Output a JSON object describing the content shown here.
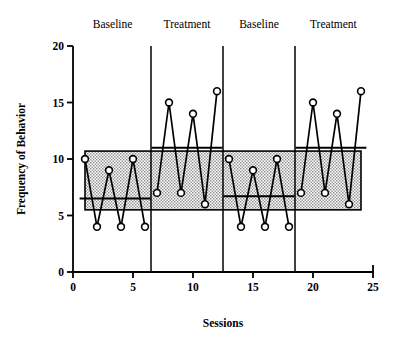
{
  "chart_data": {
    "type": "line",
    "title": "",
    "xlabel": "Sessions",
    "ylabel": "Frequency of Behavior",
    "xlim": [
      0,
      25
    ],
    "ylim": [
      0,
      20
    ],
    "xticks": [
      0,
      5,
      10,
      15,
      20,
      25
    ],
    "yticks": [
      0,
      5,
      10,
      15,
      20
    ],
    "grid": false,
    "legend": "none",
    "design": "ABAB reversal",
    "marker": "open-circle",
    "x": [
      1,
      2,
      3,
      4,
      5,
      6,
      7,
      8,
      9,
      10,
      11,
      12,
      13,
      14,
      15,
      16,
      17,
      18,
      19,
      20,
      21,
      22,
      23,
      24
    ],
    "series": [
      {
        "name": "Frequency of Behavior",
        "values": [
          10,
          4,
          9,
          4,
          10,
          4,
          7,
          15,
          7,
          14,
          6,
          16,
          10,
          4,
          9,
          4,
          10,
          4,
          7,
          15,
          7,
          14,
          6,
          16
        ]
      }
    ],
    "phases": [
      {
        "label": "Baseline",
        "x_start": 0.0,
        "x_end": 6.5,
        "x_values": [
          1,
          2,
          3,
          4,
          5,
          6
        ],
        "values": [
          10,
          4,
          9,
          4,
          10,
          4
        ],
        "mean_line": 6.5,
        "label_x": 3.3
      },
      {
        "label": "Treatment",
        "x_start": 6.5,
        "x_end": 12.5,
        "x_values": [
          7,
          8,
          9,
          10,
          11,
          12
        ],
        "values": [
          7,
          15,
          7,
          14,
          6,
          16
        ],
        "mean_line": 11.0,
        "label_x": 9.5
      },
      {
        "label": "Baseline",
        "x_start": 12.5,
        "x_end": 18.5,
        "x_values": [
          13,
          14,
          15,
          16,
          17,
          18
        ],
        "values": [
          10,
          4,
          9,
          4,
          10,
          4
        ],
        "mean_line": 6.7,
        "label_x": 15.5
      },
      {
        "label": "Treatment",
        "x_start": 18.5,
        "x_end": 25.0,
        "x_values": [
          19,
          20,
          21,
          22,
          23,
          24
        ],
        "values": [
          7,
          15,
          7,
          14,
          6,
          16
        ],
        "mean_line": 11.0,
        "label_x": 21.7
      }
    ],
    "phase_lines_x": [
      6.5,
      12.5,
      18.5
    ],
    "shaded_band": {
      "y_low": 5.5,
      "y_high": 10.7,
      "x_start": 1.0,
      "x_end": 24.0,
      "style": "dotted-fill"
    }
  },
  "axes": {
    "y_tick_labels": [
      "0",
      "5",
      "10",
      "15",
      "20"
    ],
    "x_tick_labels": [
      "0",
      "5",
      "10",
      "15",
      "20",
      "25"
    ],
    "x_title": "Sessions",
    "y_title": "Frequency of Behavior"
  },
  "phase_labels": [
    "Baseline",
    "Treatment",
    "Baseline",
    "Treatment"
  ],
  "colors": {
    "line": "#000000",
    "marker_fill": "#ffffff",
    "marker_stroke": "#000000",
    "band_fill": "#c8c8c8",
    "background": "#ffffff",
    "axis": "#000000"
  }
}
